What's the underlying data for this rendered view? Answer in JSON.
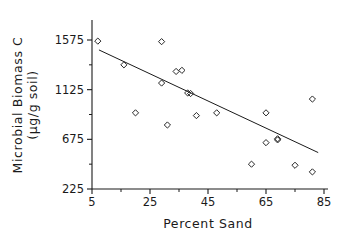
{
  "chart_data": {
    "type": "scatter",
    "title": "",
    "xlabel": "Percent Sand",
    "ylabel": "Microbial Biomass C (µg/g soil)",
    "ylabel_line1": "Microbial Biomass C",
    "ylabel_line2": "(µg/g soil)",
    "xlim": [
      5,
      85
    ],
    "ylim": [
      225,
      1575
    ],
    "xticks": [
      5,
      25,
      45,
      65,
      85
    ],
    "xtick_labels": [
      "5",
      "25",
      "45",
      "65",
      "85"
    ],
    "xminor_ticks": [
      15,
      35,
      55,
      75
    ],
    "yticks": [
      225,
      675,
      1125,
      1575
    ],
    "ytick_labels": [
      "225",
      "675",
      "1125",
      "1575"
    ],
    "yminor_ticks": [
      450,
      900,
      1350
    ],
    "grid": false,
    "legend": false,
    "marker": "open-diamond",
    "marker_color": "#262626",
    "line_color": "#1a1a1a",
    "points": [
      {
        "x": 7,
        "y": 1565
      },
      {
        "x": 16,
        "y": 1350
      },
      {
        "x": 29,
        "y": 1560
      },
      {
        "x": 29,
        "y": 1185
      },
      {
        "x": 34,
        "y": 1290
      },
      {
        "x": 36,
        "y": 1300
      },
      {
        "x": 20,
        "y": 915
      },
      {
        "x": 31,
        "y": 805
      },
      {
        "x": 38,
        "y": 1095
      },
      {
        "x": 39,
        "y": 1090
      },
      {
        "x": 41,
        "y": 890
      },
      {
        "x": 48,
        "y": 915
      },
      {
        "x": 60,
        "y": 450
      },
      {
        "x": 65,
        "y": 915
      },
      {
        "x": 65,
        "y": 645
      },
      {
        "x": 69,
        "y": 680
      },
      {
        "x": 69,
        "y": 670
      },
      {
        "x": 75,
        "y": 440
      },
      {
        "x": 81,
        "y": 1040
      },
      {
        "x": 81,
        "y": 380
      }
    ],
    "fit_line": {
      "x1": 7.4,
      "y1": 1485,
      "x2": 83.0,
      "y2": 555
    },
    "n_points": 20
  },
  "figure": {
    "background_color": "#ffffff",
    "foreground_color": "#1a1a1a"
  }
}
